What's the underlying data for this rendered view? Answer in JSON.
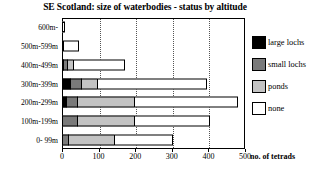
{
  "chart_data": {
    "type": "bar",
    "orientation": "horizontal",
    "stacked": true,
    "title": "SE Scotland: size of waterbodies - status by altitude",
    "xlabel": "no. of tetrads",
    "ylabel": "",
    "xlim": [
      0,
      500
    ],
    "xticks": [
      0,
      100,
      200,
      300,
      400,
      500
    ],
    "xtick_labels": [
      "0",
      "100",
      "200",
      "300",
      "400",
      "500"
    ],
    "grid": "vertical-dotted",
    "legend_position": "right",
    "categories": [
      "600m-",
      "500m-599m",
      "400m-499m",
      "300m-399m",
      "200m-299m",
      "100m-199m",
      "0- 99m"
    ],
    "series": [
      {
        "name": "large lochs",
        "color": "#000000",
        "values": [
          0,
          0,
          3,
          22,
          11,
          0,
          0
        ]
      },
      {
        "name": "small lochs",
        "color": "#7a7a7a",
        "values": [
          0,
          4,
          12,
          30,
          30,
          41,
          16
        ]
      },
      {
        "name": "ponds",
        "color": "#c3c3c3",
        "values": [
          0,
          0,
          16,
          44,
          156,
          156,
          126
        ]
      },
      {
        "name": "none",
        "color": "#ffffff",
        "values": [
          8,
          43,
          141,
          300,
          284,
          207,
          161
        ]
      }
    ],
    "totals": [
      8,
      47,
      172,
      396,
      481,
      404,
      303
    ]
  },
  "legend": {
    "items": [
      {
        "label": "large lochs",
        "color": "#000000"
      },
      {
        "label": "small lochs",
        "color": "#7a7a7a"
      },
      {
        "label": "ponds",
        "color": "#c3c3c3"
      },
      {
        "label": "none",
        "color": "#ffffff"
      }
    ]
  }
}
